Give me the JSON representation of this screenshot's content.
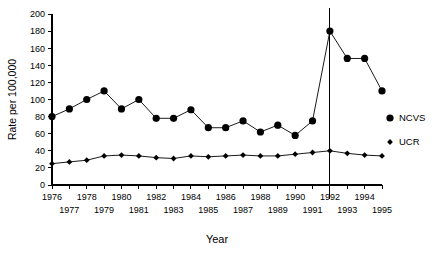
{
  "chart_data": {
    "type": "line",
    "title": "",
    "xlabel": "Year",
    "ylabel": "Rate per 100,000",
    "x": [
      1976,
      1977,
      1978,
      1979,
      1980,
      1981,
      1982,
      1983,
      1984,
      1985,
      1986,
      1987,
      1988,
      1989,
      1990,
      1991,
      1992,
      1993,
      1994,
      1995
    ],
    "categories": [
      "1976",
      "1977",
      "1978",
      "1979",
      "1980",
      "1981",
      "1982",
      "1983",
      "1984",
      "1985",
      "1986",
      "1987",
      "1988",
      "1989",
      "1990",
      "1991",
      "1992",
      "1993",
      "1994",
      "1995"
    ],
    "series": [
      {
        "name": "NCVS",
        "marker": "circle",
        "values": [
          80,
          89,
          100,
          110,
          89,
          100,
          78,
          78,
          88,
          67,
          67,
          75,
          62,
          70,
          58,
          75,
          180,
          148,
          148,
          110
        ]
      },
      {
        "name": "UCR",
        "marker": "diamond",
        "values": [
          25,
          27,
          29,
          34,
          35,
          34,
          32,
          31,
          34,
          33,
          34,
          35,
          34,
          34,
          36,
          38,
          40,
          37,
          35,
          34
        ]
      }
    ],
    "xlim": [
      1976,
      1995
    ],
    "ylim": [
      0,
      200
    ],
    "yticks": [
      0,
      20,
      40,
      60,
      80,
      100,
      120,
      140,
      160,
      180,
      200
    ],
    "ytick_labels": [
      "0",
      "20",
      "40",
      "60",
      "80",
      "100",
      "120",
      "140",
      "160",
      "180",
      "200"
    ],
    "xticks": [
      1976,
      1977,
      1978,
      1979,
      1980,
      1981,
      1982,
      1983,
      1984,
      1985,
      1986,
      1987,
      1988,
      1989,
      1990,
      1991,
      1992,
      1993,
      1994,
      1995
    ],
    "xtick_rows": {
      "top": [
        "1976",
        "1978",
        "1980",
        "1982",
        "1984",
        "1986",
        "1988",
        "1990",
        "1992",
        "1994"
      ],
      "bottom": [
        "1977",
        "1979",
        "1981",
        "1983",
        "1985",
        "1987",
        "1989",
        "1991",
        "1993",
        "1995"
      ]
    },
    "grid": false,
    "legend_position": "right-inside",
    "annotations": [
      {
        "type": "vertical-line",
        "x": 1992,
        "label": ""
      }
    ],
    "colors": {
      "series": "#000000",
      "axis": "#000000",
      "background": "#ffffff"
    }
  },
  "axes": {
    "y_title": "Rate per 100,000",
    "x_title": "Year"
  },
  "legend": {
    "items": [
      {
        "label": "NCVS",
        "marker": "circle"
      },
      {
        "label": "UCR",
        "marker": "diamond"
      }
    ]
  }
}
